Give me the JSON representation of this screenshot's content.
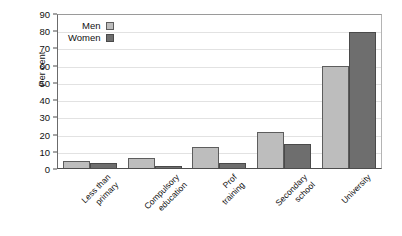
{
  "chart_data": {
    "type": "bar",
    "title": "",
    "xlabel": "",
    "ylabel": "Per cent",
    "ylim": [
      0,
      90
    ],
    "ytick_step": 10,
    "yticks": [
      0,
      10,
      20,
      30,
      40,
      50,
      60,
      70,
      80,
      90
    ],
    "grid": true,
    "legend_position": "top-left-inside",
    "categories": [
      {
        "line1": "Less than",
        "line2": "primary"
      },
      {
        "line1": "Compulsory",
        "line2": "education"
      },
      {
        "line1": "Prof",
        "line2": "training"
      },
      {
        "line1": "Secondary",
        "line2": "school"
      },
      {
        "line1": "University",
        "line2": ""
      }
    ],
    "category_names": [
      "Less than primary",
      "Compulsory education",
      "Prof training",
      "Secondary school",
      "University"
    ],
    "series": [
      {
        "name": "Men",
        "color": "#bdbdbd",
        "values": [
          4,
          6,
          12,
          21,
          59
        ]
      },
      {
        "name": "Women",
        "color": "#6e6e6e",
        "values": [
          3,
          1,
          3,
          14,
          79
        ]
      }
    ]
  },
  "legend": {
    "items": [
      {
        "label": "Men",
        "swatch": "men-swatch"
      },
      {
        "label": "Women",
        "swatch": "women-swatch"
      }
    ]
  }
}
